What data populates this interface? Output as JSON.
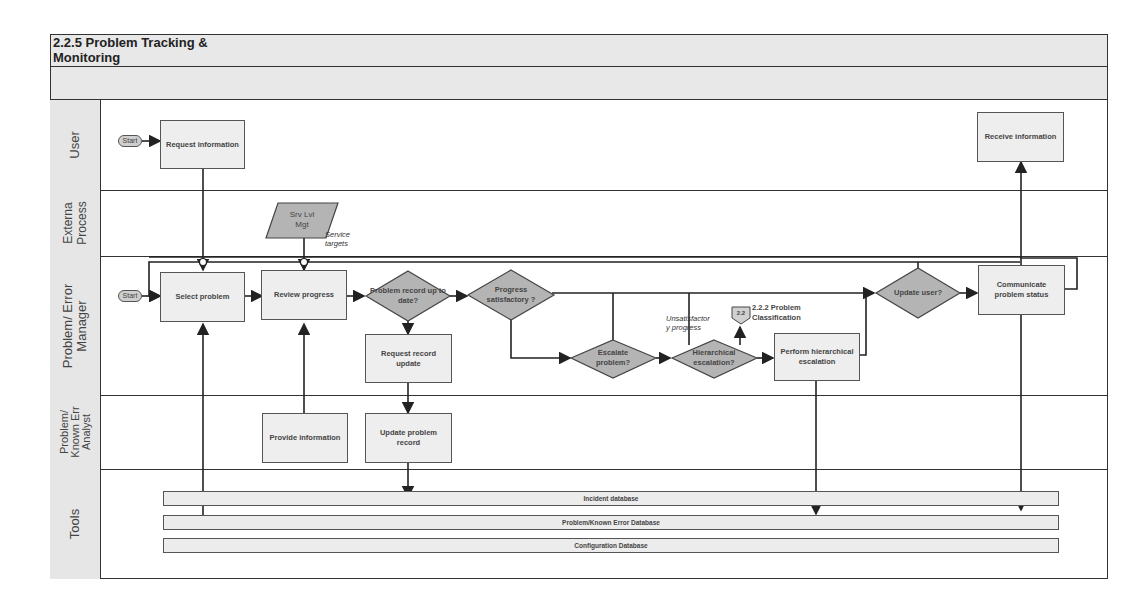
{
  "title": "2.2.5 Problem Tracking & Monitoring",
  "lanes": [
    {
      "id": "user",
      "label": "User"
    },
    {
      "id": "external",
      "label": "Externa\nProcess"
    },
    {
      "id": "manager",
      "label": "Problem/ Error\nManager"
    },
    {
      "id": "analyst",
      "label": "Problem/\nKnown Err\nAnalyst"
    },
    {
      "id": "tools",
      "label": "Tools"
    }
  ],
  "starts": {
    "user": "Start",
    "manager": "Start"
  },
  "nodes": {
    "request_information": "Request information",
    "receive_information": "Receive information",
    "srv_lvl_mgt": "Srv Lvl Mgt",
    "select_problem": "Select problem",
    "review_progress": "Review progress",
    "problem_record_up_to_date": "Problem record up to date?",
    "progress_satisfactory": "Progress satisfactory ?",
    "escalate_problem": "Escalate problem?",
    "hierarchical_escalation": "Hierarchical escalation?",
    "perform_hierarchical_escalation": "Perform hierarchical escalation",
    "update_user": "Update user?",
    "communicate_problem_status": "Communicate problem status",
    "request_record_update": "Request record update",
    "provide_information": "Provide information",
    "update_problem_record": "Update problem record"
  },
  "annotations": {
    "service_targets": "Service targets",
    "unsatisfactory_progress": "Unsatisfactor y progress",
    "offpage_ref_label": "2.2",
    "problem_classification": "2.2.2 Problem Classification"
  },
  "tools": [
    "Incident database",
    "Problem/Known Error Database",
    "Configuration Database"
  ]
}
